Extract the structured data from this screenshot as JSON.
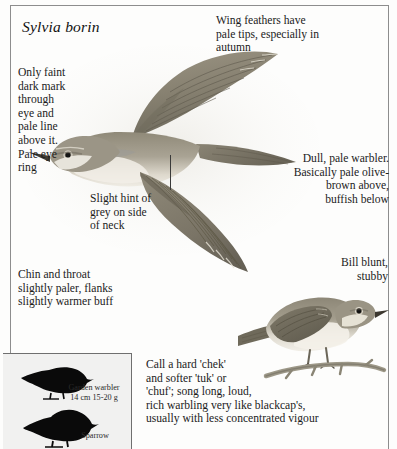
{
  "page": {
    "species_name": "Sylvia borin"
  },
  "captions": {
    "eye": "Only faint\ndark mark\nthrough\neye and\npale line\nabove it.\nPale eye\nring",
    "wing": "Wing feathers have\npale tips, especially in\nautumn",
    "neck": "Slight hint of\ngrey on side\nof neck",
    "dull": "Dull, pale warbler.\nBasically pale olive-\nbrown above,\nbuffish below",
    "chin": "Chin and throat\nslightly paler, flanks\nslightly warmer buff",
    "bill": "Bill blunt,\nstubby",
    "call": "Call a hard 'chek'\nand softer 'tuk' or\n'chuf'; song long, loud,\nrich warbling very like blackcap's,\nusually with less concentrated vigour"
  },
  "size_inset": {
    "warbler_label": "Garden warbler\n14 cm  15-20 g",
    "sparrow_label": "Sparrow"
  },
  "colors": {
    "rule": "#8d8d8d",
    "text": "#1b1b1b",
    "inset_background": "#f1f1f0",
    "bird_upper": "#8e8878",
    "bird_under": "#e8e4da",
    "silhouette": "#0a0a0a"
  }
}
